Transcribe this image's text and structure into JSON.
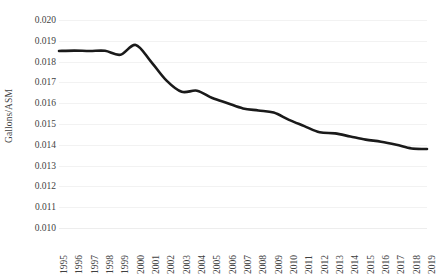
{
  "chart_data": {
    "type": "line",
    "title": "",
    "subtitle": "",
    "xlabel": "",
    "ylabel": "Gallons/ASM",
    "x": [
      1995,
      1996,
      1997,
      1998,
      1999,
      2000,
      2001,
      2002,
      2003,
      2004,
      2005,
      2006,
      2007,
      2008,
      2009,
      2010,
      2011,
      2012,
      2013,
      2014,
      2015,
      2016,
      2017,
      2018,
      2019
    ],
    "categories": [
      "1995",
      "1996",
      "1997",
      "1998",
      "1999",
      "2000",
      "2001",
      "2002",
      "2003",
      "2004",
      "2005",
      "2006",
      "2007",
      "2008",
      "2009",
      "2010",
      "2011",
      "2012",
      "2013",
      "2014",
      "2015",
      "2016",
      "2017",
      "2018",
      "2019"
    ],
    "values": [
      0.01851,
      0.01853,
      0.01851,
      0.01852,
      0.01833,
      0.0188,
      0.018,
      0.0171,
      0.01655,
      0.0166,
      0.01625,
      0.016,
      0.01575,
      0.01565,
      0.01555,
      0.0152,
      0.0149,
      0.0146,
      0.01455,
      0.0144,
      0.01425,
      0.01415,
      0.014,
      0.01382,
      0.0138
    ],
    "series": [
      {
        "name": "Gallons/ASM",
        "color": "#1a1a1a",
        "line_width": 2.6,
        "smooth": true,
        "markers": false,
        "values": [
          0.01851,
          0.01853,
          0.01851,
          0.01852,
          0.01833,
          0.0188,
          0.018,
          0.0171,
          0.01655,
          0.0166,
          0.01625,
          0.016,
          0.01575,
          0.01565,
          0.01555,
          0.0152,
          0.0149,
          0.0146,
          0.01455,
          0.0144,
          0.01425,
          0.01415,
          0.014,
          0.01382,
          0.0138
        ]
      }
    ],
    "ylim": [
      0.01,
      0.02
    ],
    "yticks": [
      0.01,
      0.011,
      0.012,
      0.013,
      0.014,
      0.015,
      0.016,
      0.017,
      0.018,
      0.019,
      0.02
    ],
    "ytick_labels": [
      "0.010",
      "0.011",
      "0.012",
      "0.013",
      "0.014",
      "0.015",
      "0.016",
      "0.017",
      "0.018",
      "0.019",
      "0.020"
    ],
    "xlim": [
      1995,
      2019
    ],
    "grid": {
      "horizontal": true,
      "vertical": false,
      "color": "#f2f2f2"
    },
    "legend": {
      "visible": false,
      "position": "none",
      "entries": []
    },
    "annotations": [],
    "background_color": "#ffffff",
    "axis_label_color": "#3f3f3f",
    "xtick_rotation": -90
  }
}
